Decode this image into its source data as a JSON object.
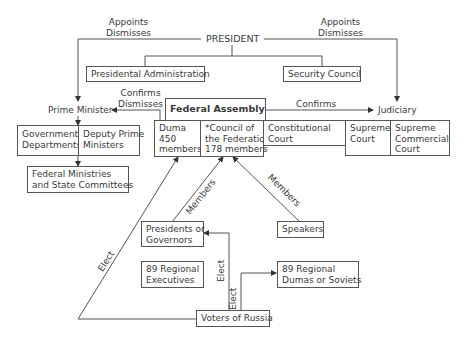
{
  "diagram": {
    "president": "PRESIDENT",
    "labels": {
      "appoints_dismisses_left": [
        "Appoints",
        "Dismisses"
      ],
      "appoints_dismisses_right": [
        "Appoints",
        "Dismisses"
      ],
      "confirms_dismisses": [
        "Confirms",
        "Dismisses"
      ],
      "confirms": "Confirms",
      "members_left": "Members",
      "members_right": "Members",
      "elect_left": "Elect",
      "elect_governors": "Elect",
      "elect_dumas": "Elect"
    },
    "nodes": {
      "presidential_administration": "Presidental Administration",
      "security_council": "Security Council",
      "prime_minister": "Prime Minister",
      "judiciary": "Judiciary",
      "federal_assembly": "Federal Assembly",
      "duma": [
        "Duma",
        "450",
        "members"
      ],
      "council_federation": [
        "*Council of",
        "the Federation",
        "178 members"
      ],
      "constitutional_court": [
        "Constitutional",
        "Court"
      ],
      "supreme_court": [
        "Supreme",
        "Court"
      ],
      "supreme_commercial_court": [
        "Supreme",
        "Commercial",
        "Court"
      ],
      "government_departments": [
        "Government",
        "Departments"
      ],
      "deputy_prime_ministers": [
        "Deputy Prime",
        "Ministers"
      ],
      "federal_ministries": [
        "Federal Ministries",
        "and State Committees"
      ],
      "presidents_governors": [
        "Presidents or",
        "Governors"
      ],
      "speakers": "Speakers",
      "regional_executives": [
        "89 Regional",
        "Executives"
      ],
      "regional_dumas": [
        "89 Regional",
        "Dumas or Soviets"
      ],
      "voters": "Voters of Russia"
    }
  }
}
